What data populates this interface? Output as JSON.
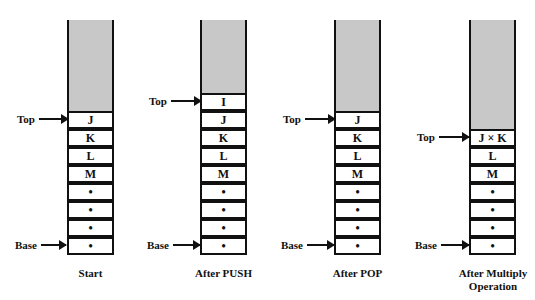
{
  "diagram": {
    "pointer_labels": {
      "top": "Top",
      "base": "Base"
    },
    "colors": {
      "empty_region": "#c8c8c8",
      "border": "#111111",
      "cell_bg": "#ffffff"
    },
    "stacks": [
      {
        "caption": "Start",
        "caption_line2": "",
        "cells": [
          "J",
          "K",
          "L",
          "M",
          "•",
          "•",
          "•",
          "•"
        ],
        "top_index": 0,
        "base_index": 7
      },
      {
        "caption": "After PUSH",
        "caption_line2": "",
        "cells": [
          "I",
          "J",
          "K",
          "L",
          "M",
          "•",
          "•",
          "•",
          "•"
        ],
        "top_index": 0,
        "base_index": 8
      },
      {
        "caption": "After POP",
        "caption_line2": "",
        "cells": [
          "J",
          "K",
          "L",
          "M",
          "•",
          "•",
          "•",
          "•"
        ],
        "top_index": 0,
        "base_index": 7
      },
      {
        "caption": "After Multiply",
        "caption_line2": "Operation",
        "cells": [
          "J × K",
          "L",
          "M",
          "•",
          "•",
          "•",
          "•"
        ],
        "top_index": 0,
        "base_index": 6
      }
    ]
  }
}
